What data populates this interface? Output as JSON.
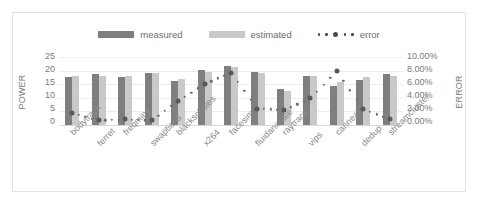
{
  "chart_data": {
    "type": "bar",
    "title": "",
    "subtitle": "",
    "xlabel": "",
    "ylabel": "POWER",
    "y2label": "ERROR",
    "ylim": [
      0,
      25
    ],
    "y2lim": [
      0,
      0.1
    ],
    "grid": true,
    "legend_position": "top-center",
    "categories": [
      "bodytrack",
      "ferret",
      "freqmine",
      "swaptions",
      "blackscholes",
      "x264",
      "facesim",
      "fluidanimate",
      "raytrace",
      "vips",
      "canneal",
      "dedup",
      "streamcluster"
    ],
    "series": [
      {
        "name": "measured",
        "axis": "left",
        "color": "#7f7f7f",
        "values": [
          17.8,
          18.6,
          17.6,
          19.0,
          16.2,
          20.4,
          21.8,
          19.6,
          13.1,
          17.9,
          14.4,
          16.5,
          18.6
        ]
      },
      {
        "name": "estimated",
        "axis": "left",
        "color": "#c9c9c9",
        "values": [
          18.1,
          18.2,
          18.0,
          19.2,
          17.0,
          19.6,
          21.2,
          19.3,
          12.6,
          18.1,
          15.9,
          17.5,
          18.2
        ]
      },
      {
        "name": "error",
        "axis": "right",
        "color": "#595959",
        "marker": "dotted-circle",
        "values": [
          0.0172,
          0.0068,
          0.0082,
          0.0068,
          0.0352,
          0.06,
          0.077,
          0.024,
          0.0218,
          0.0392,
          0.079,
          0.023,
          0.0082
        ]
      }
    ],
    "yticks": [
      "25",
      "20",
      "15",
      "10",
      "5",
      "0"
    ],
    "y2ticks": [
      "10.00%",
      "8.00%",
      "6.00%",
      "4.00%",
      "2.00%",
      "0.00%"
    ],
    "legend": [
      {
        "label": "measured",
        "type": "swatch",
        "color": "#7f7f7f"
      },
      {
        "label": "estimated",
        "type": "swatch",
        "color": "#c9c9c9"
      },
      {
        "label": "error",
        "type": "dots",
        "color": "#4a4a4a"
      }
    ]
  }
}
